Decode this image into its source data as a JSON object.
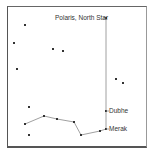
{
  "labels": {
    "polaris": "Polaris, North Star",
    "dubhe": "Dubhe",
    "merak": "Merak"
  },
  "colors": {
    "line": "#888888",
    "star": "#333333",
    "frame": "#555555"
  },
  "stars": [
    {
      "x": 25,
      "y": 25
    },
    {
      "x": 14,
      "y": 43
    },
    {
      "x": 53,
      "y": 49
    },
    {
      "x": 63,
      "y": 51
    },
    {
      "x": 17,
      "y": 69
    },
    {
      "x": 116,
      "y": 79
    },
    {
      "x": 123,
      "y": 83
    },
    {
      "x": 29,
      "y": 107
    },
    {
      "x": 29,
      "y": 135
    }
  ],
  "dipper": [
    {
      "x": 25,
      "y": 124
    },
    {
      "x": 44,
      "y": 116
    },
    {
      "x": 57,
      "y": 119
    },
    {
      "x": 74,
      "y": 122
    },
    {
      "x": 81,
      "y": 135
    },
    {
      "x": 100,
      "y": 131
    },
    {
      "x": 106,
      "y": 129
    }
  ],
  "pointer": {
    "merak": {
      "x": 106,
      "y": 129
    },
    "dubhe": {
      "x": 106,
      "y": 111
    },
    "polaris": {
      "x": 106,
      "y": 18
    }
  }
}
